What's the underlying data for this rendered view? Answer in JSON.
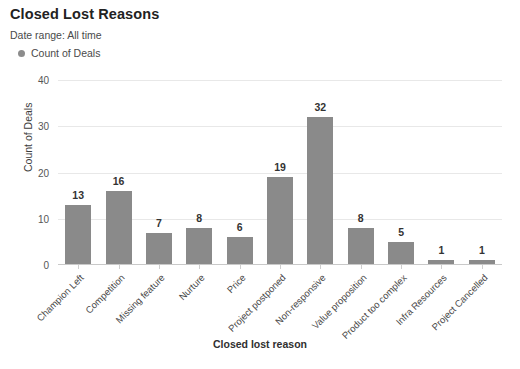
{
  "header": {
    "title": "Closed Lost Reasons",
    "date_range": "Date range: All time"
  },
  "legend": {
    "items": [
      {
        "label": "Count of Deals",
        "color": "#8c8c8c"
      }
    ]
  },
  "chart_data": {
    "type": "bar",
    "title": "Closed Lost Reasons",
    "xlabel": "Closed lost reason",
    "ylabel": "Count of Deals",
    "ylim": [
      0,
      40
    ],
    "yticks": [
      0,
      10,
      20,
      30,
      40
    ],
    "grid": true,
    "legend_position": "top-left",
    "bar_color": "#8a8a8a",
    "categories": [
      "Champion Left",
      "Competition",
      "Missing feature",
      "Nurture",
      "Price",
      "Project postponed",
      "Non-responsive",
      "Value proposition",
      "Product too complex",
      "Infra Resources",
      "Project Cancelled"
    ],
    "series": [
      {
        "name": "Count of Deals",
        "values": [
          13,
          16,
          7,
          8,
          6,
          19,
          32,
          8,
          5,
          1,
          1
        ]
      }
    ]
  }
}
